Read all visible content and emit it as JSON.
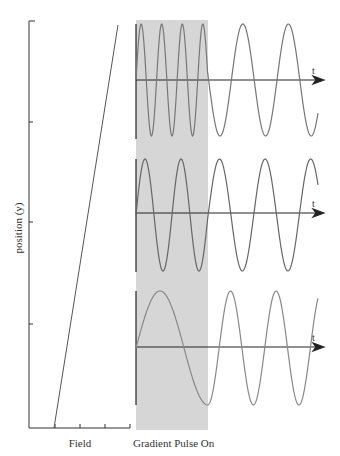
{
  "diagram": {
    "title": "",
    "y_axis_label": "position (y)",
    "x_axis_label": "Field",
    "pulse_label": "Gradient Pulse On",
    "time_axis_label": "t",
    "colors": {
      "axis": "#333333",
      "wave": "#777777",
      "band": "#d6d6d6",
      "field_line": "#555555"
    },
    "panels": [
      {
        "name": "top",
        "position": "high y",
        "cycles_during_pulse": 3.5,
        "cycles_after_pulse": 2.5
      },
      {
        "name": "middle",
        "position": "mid y",
        "cycles_during_pulse": 2,
        "cycles_after_pulse": 2.5
      },
      {
        "name": "bottom",
        "position": "low y",
        "cycles_during_pulse": 0.75,
        "cycles_after_pulse": 2.5
      }
    ]
  }
}
